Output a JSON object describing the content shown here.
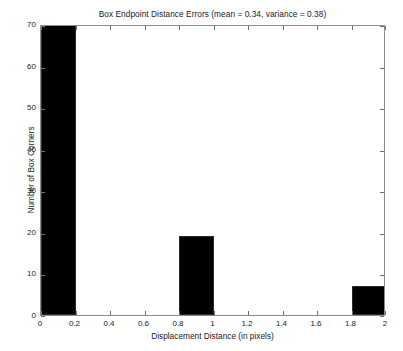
{
  "chart_data": {
    "type": "bar",
    "title": "Box Endpoint Distance Errors (mean = 0.34, variance = 0.38)",
    "xlabel": "Displacement Distance (in pixels)",
    "ylabel": "Number of Box Corners",
    "grid": false,
    "legend": "none",
    "bar_color": "#000000",
    "frame_color": "#8d8d8d",
    "xlim": [
      0,
      2
    ],
    "ylim": [
      0,
      70
    ],
    "bin_width": 0.2,
    "x_ticks": [
      0,
      0.2,
      0.4,
      0.6,
      0.8,
      1,
      1.2,
      1.4,
      1.6,
      1.8,
      2
    ],
    "x_tick_labels": [
      "0",
      "0.2",
      "0.4",
      "0.6",
      "0.8",
      "1",
      "1.2",
      "1.4",
      "1.6",
      "1.8",
      "2"
    ],
    "y_ticks": [
      0,
      10,
      20,
      30,
      40,
      50,
      60,
      70
    ],
    "y_tick_labels": [
      "0",
      "10",
      "20",
      "30",
      "40",
      "50",
      "60",
      "70"
    ],
    "bins": [
      {
        "label": "0 - 0.2",
        "x0": 0.0,
        "x1": 0.2,
        "value": 70
      },
      {
        "label": "0.2 - 0.4",
        "x0": 0.2,
        "x1": 0.4,
        "value": 0
      },
      {
        "label": "0.4 - 0.6",
        "x0": 0.4,
        "x1": 0.6,
        "value": 0
      },
      {
        "label": "0.6 - 0.8",
        "x0": 0.6,
        "x1": 0.8,
        "value": 0
      },
      {
        "label": "0.8 - 1.0",
        "x0": 0.8,
        "x1": 1.0,
        "value": 19
      },
      {
        "label": "1.0 - 1.2",
        "x0": 1.0,
        "x1": 1.2,
        "value": 0
      },
      {
        "label": "1.2 - 1.4",
        "x0": 1.2,
        "x1": 1.4,
        "value": 0
      },
      {
        "label": "1.4 - 1.6",
        "x0": 1.4,
        "x1": 1.6,
        "value": 0
      },
      {
        "label": "1.6 - 1.8",
        "x0": 1.6,
        "x1": 1.8,
        "value": 0
      },
      {
        "label": "1.8 - 2.0",
        "x0": 1.8,
        "x1": 2.0,
        "value": 7
      }
    ],
    "categories": [
      "0 - 0.2",
      "0.2 - 0.4",
      "0.4 - 0.6",
      "0.6 - 0.8",
      "0.8 - 1.0",
      "1.0 - 1.2",
      "1.2 - 1.4",
      "1.4 - 1.6",
      "1.6 - 1.8",
      "1.8 - 2.0"
    ],
    "values": [
      70,
      0,
      0,
      0,
      19,
      0,
      0,
      0,
      0,
      7
    ],
    "stats": {
      "mean": 0.34,
      "variance": 0.38
    }
  }
}
